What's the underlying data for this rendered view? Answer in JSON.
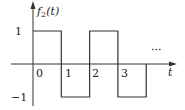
{
  "chart_data": {
    "type": "line",
    "subtype": "step",
    "title": "",
    "ylabel": "f2(t)",
    "ylabel_display": {
      "base": "f",
      "sub": "2",
      "arg": "(t)"
    },
    "xlabel": "t",
    "x_ticks": [
      "0",
      "1",
      "2",
      "3"
    ],
    "y_ticks": [
      "1",
      "−1"
    ],
    "ylim": [
      -1,
      1
    ],
    "xlim": [
      0,
      4
    ],
    "continuation": "…",
    "segments": [
      {
        "x_start": 0,
        "x_end": 1,
        "value": 1
      },
      {
        "x_start": 1,
        "x_end": 2,
        "value": -1
      },
      {
        "x_start": 2,
        "x_end": 3,
        "value": 1
      },
      {
        "x_start": 3,
        "x_end": 4,
        "value": -1
      }
    ],
    "x": [
      0,
      1,
      1,
      2,
      2,
      3,
      3,
      4
    ],
    "values": [
      1,
      1,
      -1,
      -1,
      1,
      1,
      -1,
      -1
    ],
    "grid": false,
    "legend": null
  },
  "labels": {
    "y_axis_base": "f",
    "y_axis_sub": "2",
    "y_axis_arg": "(t)",
    "x_axis": "t",
    "tick_0": "0",
    "tick_1": "1",
    "tick_2": "2",
    "tick_3": "3",
    "y_pos": "1",
    "y_neg": "−1",
    "ellipsis": "···"
  },
  "colors": {
    "line": "#333333",
    "axis": "#333333",
    "background": "#ffffff"
  }
}
